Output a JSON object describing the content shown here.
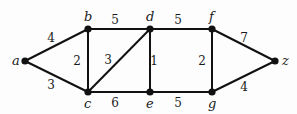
{
  "graph": {
    "type": "weighted-undirected",
    "nodes": [
      {
        "id": "a",
        "label": "a",
        "x": 25,
        "y": 61,
        "lx": 12,
        "ly": 65
      },
      {
        "id": "b",
        "label": "b",
        "x": 88,
        "y": 29,
        "lx": 84,
        "ly": 21
      },
      {
        "id": "c",
        "label": "c",
        "x": 88,
        "y": 92,
        "lx": 84,
        "ly": 108
      },
      {
        "id": "d",
        "label": "d",
        "x": 150,
        "y": 29,
        "lx": 146,
        "ly": 21
      },
      {
        "id": "e",
        "label": "e",
        "x": 150,
        "y": 92,
        "lx": 146,
        "ly": 108
      },
      {
        "id": "f",
        "label": "f",
        "x": 212,
        "y": 29,
        "lx": 209,
        "ly": 21
      },
      {
        "id": "g",
        "label": "g",
        "x": 212,
        "y": 92,
        "lx": 208,
        "ly": 108
      },
      {
        "id": "z",
        "label": "z",
        "x": 275,
        "y": 61,
        "lx": 282,
        "ly": 65
      }
    ],
    "edges": [
      {
        "from": "a",
        "to": "b",
        "weight": "4",
        "wx": 51,
        "wy": 42
      },
      {
        "from": "a",
        "to": "c",
        "weight": "3",
        "wx": 51,
        "wy": 89
      },
      {
        "from": "b",
        "to": "c",
        "weight": "2",
        "wx": 77,
        "wy": 65
      },
      {
        "from": "b",
        "to": "d",
        "weight": "5",
        "wx": 115,
        "wy": 24
      },
      {
        "from": "c",
        "to": "d",
        "weight": "3",
        "wx": 108,
        "wy": 64
      },
      {
        "from": "c",
        "to": "e",
        "weight": "6",
        "wx": 115,
        "wy": 107
      },
      {
        "from": "d",
        "to": "e",
        "weight": "1",
        "wx": 154,
        "wy": 65
      },
      {
        "from": "d",
        "to": "f",
        "weight": "5",
        "wx": 178,
        "wy": 24
      },
      {
        "from": "e",
        "to": "g",
        "weight": "5",
        "wx": 178,
        "wy": 107
      },
      {
        "from": "f",
        "to": "g",
        "weight": "2",
        "wx": 202,
        "wy": 65
      },
      {
        "from": "f",
        "to": "z",
        "weight": "7",
        "wx": 244,
        "wy": 42
      },
      {
        "from": "g",
        "to": "z",
        "weight": "4",
        "wx": 244,
        "wy": 91
      }
    ]
  },
  "colors": {
    "edge": "#111111",
    "node": "#111111",
    "text": "#1a1a1a",
    "background": "#fdfdfd"
  }
}
